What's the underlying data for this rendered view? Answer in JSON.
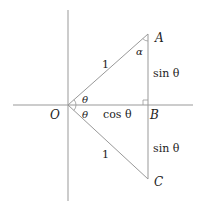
{
  "diagram": {
    "points": {
      "O": {
        "label": "O",
        "x": 68,
        "y": 105
      },
      "A": {
        "label": "A",
        "x": 148,
        "y": 34
      },
      "B": {
        "label": "B",
        "x": 148,
        "y": 105
      },
      "C": {
        "label": "C",
        "x": 148,
        "y": 179
      }
    },
    "labels": {
      "oa_length": "1",
      "oc_length": "1",
      "ab_length": "sin θ",
      "bc_length": "sin θ",
      "ob_length": "cos θ",
      "angle_aob": "θ",
      "angle_boc": "θ",
      "angle_a": "α"
    },
    "colors": {
      "axis": "#999999",
      "triangle": "#999999",
      "text": "#222222"
    }
  }
}
